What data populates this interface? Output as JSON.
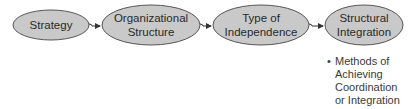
{
  "diagram": {
    "type": "flow",
    "direction": "left-to-right",
    "colors": {
      "node_fill": "#c9c9c9",
      "node_stroke": "#555555",
      "arrow": "#333333",
      "text": "#2a2a2a"
    },
    "nodes": [
      {
        "id": "strategy",
        "label": "Strategy"
      },
      {
        "id": "organizational-structure",
        "label": "Organizational\nStructure"
      },
      {
        "id": "type-of-independence",
        "label": "Type of\nIndependence"
      },
      {
        "id": "structural-integration",
        "label": "Structural\nIntegration"
      }
    ],
    "edges": [
      {
        "from": "strategy",
        "to": "organizational-structure"
      },
      {
        "from": "organizational-structure",
        "to": "type-of-independence"
      },
      {
        "from": "type-of-independence",
        "to": "structural-integration"
      }
    ],
    "annotation": {
      "attached_to": "structural-integration",
      "bullet": "•",
      "text": "Methods of\nAchieving\nCoordination\nor Integration"
    }
  }
}
